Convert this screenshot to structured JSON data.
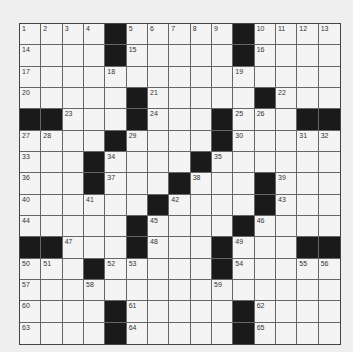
{
  "puzzle": {
    "rows": 15,
    "cols": 15,
    "black_color": "#1a1a1a",
    "white_color": "#f4f4f4",
    "grid": [
      "....#.....#....",
      "....#.....#....",
      "...............",
      ".....#.....#...",
      "##...#...#...##",
      "....#....#.....",
      "...#....#......",
      "...#...#...#...",
      "......#....#...",
      ".....#....#....",
      "##...#...#...##",
      "...#.....#.....",
      "...............",
      "....#.....#....",
      "....#.....#...."
    ],
    "numbers": [
      {
        "r": 0,
        "c": 0,
        "n": "1"
      },
      {
        "r": 0,
        "c": 1,
        "n": "2"
      },
      {
        "r": 0,
        "c": 2,
        "n": "3"
      },
      {
        "r": 0,
        "c": 3,
        "n": "4"
      },
      {
        "r": 0,
        "c": 5,
        "n": "5"
      },
      {
        "r": 0,
        "c": 6,
        "n": "6"
      },
      {
        "r": 0,
        "c": 7,
        "n": "7"
      },
      {
        "r": 0,
        "c": 8,
        "n": "8"
      },
      {
        "r": 0,
        "c": 9,
        "n": "9"
      },
      {
        "r": 0,
        "c": 11,
        "n": "10"
      },
      {
        "r": 0,
        "c": 12,
        "n": "11"
      },
      {
        "r": 0,
        "c": 13,
        "n": "12"
      },
      {
        "r": 0,
        "c": 14,
        "n": "13"
      },
      {
        "r": 1,
        "c": 0,
        "n": "14"
      },
      {
        "r": 1,
        "c": 5,
        "n": "15"
      },
      {
        "r": 1,
        "c": 11,
        "n": "16"
      },
      {
        "r": 2,
        "c": 0,
        "n": "17"
      },
      {
        "r": 2,
        "c": 4,
        "n": "18"
      },
      {
        "r": 2,
        "c": 10,
        "n": "19"
      },
      {
        "r": 3,
        "c": 0,
        "n": "20"
      },
      {
        "r": 3,
        "c": 6,
        "n": "21"
      },
      {
        "r": 3,
        "c": 12,
        "n": "22"
      },
      {
        "r": 4,
        "c": 2,
        "n": "23"
      },
      {
        "r": 4,
        "c": 6,
        "n": "24"
      },
      {
        "r": 4,
        "c": 10,
        "n": "25"
      },
      {
        "r": 4,
        "c": 11,
        "n": "26"
      },
      {
        "r": 5,
        "c": 0,
        "n": "27"
      },
      {
        "r": 5,
        "c": 1,
        "n": "28"
      },
      {
        "r": 5,
        "c": 5,
        "n": "29"
      },
      {
        "r": 5,
        "c": 10,
        "n": "30"
      },
      {
        "r": 5,
        "c": 13,
        "n": "31"
      },
      {
        "r": 5,
        "c": 14,
        "n": "32"
      },
      {
        "r": 6,
        "c": 0,
        "n": "33"
      },
      {
        "r": 6,
        "c": 4,
        "n": "34"
      },
      {
        "r": 6,
        "c": 9,
        "n": "35"
      },
      {
        "r": 7,
        "c": 0,
        "n": "36"
      },
      {
        "r": 7,
        "c": 4,
        "n": "37"
      },
      {
        "r": 7,
        "c": 8,
        "n": "38"
      },
      {
        "r": 7,
        "c": 12,
        "n": "39"
      },
      {
        "r": 8,
        "c": 0,
        "n": "40"
      },
      {
        "r": 8,
        "c": 3,
        "n": "41"
      },
      {
        "r": 8,
        "c": 7,
        "n": "42"
      },
      {
        "r": 8,
        "c": 12,
        "n": "43"
      },
      {
        "r": 9,
        "c": 0,
        "n": "44"
      },
      {
        "r": 9,
        "c": 6,
        "n": "45"
      },
      {
        "r": 9,
        "c": 11,
        "n": "46"
      },
      {
        "r": 10,
        "c": 2,
        "n": "47"
      },
      {
        "r": 10,
        "c": 6,
        "n": "48"
      },
      {
        "r": 10,
        "c": 10,
        "n": "49"
      },
      {
        "r": 11,
        "c": 0,
        "n": "50"
      },
      {
        "r": 11,
        "c": 1,
        "n": "51"
      },
      {
        "r": 11,
        "c": 4,
        "n": "52"
      },
      {
        "r": 11,
        "c": 5,
        "n": "53"
      },
      {
        "r": 11,
        "c": 10,
        "n": "54"
      },
      {
        "r": 11,
        "c": 13,
        "n": "55"
      },
      {
        "r": 11,
        "c": 14,
        "n": "56"
      },
      {
        "r": 12,
        "c": 0,
        "n": "57"
      },
      {
        "r": 12,
        "c": 3,
        "n": "58"
      },
      {
        "r": 12,
        "c": 9,
        "n": "59"
      },
      {
        "r": 13,
        "c": 0,
        "n": "60"
      },
      {
        "r": 13,
        "c": 5,
        "n": "61"
      },
      {
        "r": 13,
        "c": 11,
        "n": "62"
      },
      {
        "r": 14,
        "c": 0,
        "n": "63"
      },
      {
        "r": 14,
        "c": 5,
        "n": "64"
      },
      {
        "r": 14,
        "c": 11,
        "n": "65"
      }
    ]
  }
}
